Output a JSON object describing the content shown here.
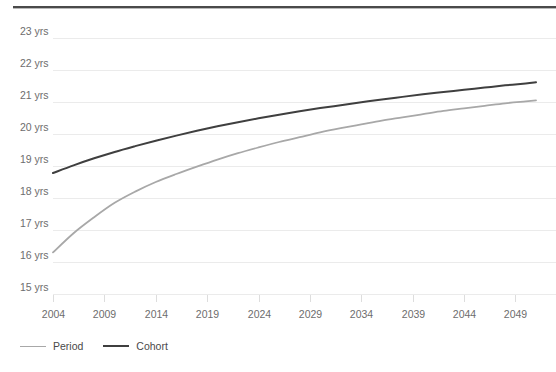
{
  "chart_data": {
    "type": "line",
    "title": "",
    "subtitle": "",
    "xlabel": "",
    "ylabel": "",
    "xlim": [
      2004,
      2051
    ],
    "ylim": [
      15,
      23
    ],
    "grid": true,
    "legend_position": "bottom-left",
    "y_tick_labels": [
      "23 yrs",
      "22 yrs",
      "21 yrs",
      "20 yrs",
      "19 yrs",
      "18 yrs",
      "17 yrs",
      "16 yrs",
      "15 yrs"
    ],
    "y_tick_values": [
      23,
      22,
      21,
      20,
      19,
      18,
      17,
      16,
      15
    ],
    "x_tick_labels": [
      "2004",
      "2009",
      "2014",
      "2019",
      "2024",
      "2029",
      "2034",
      "2039",
      "2044",
      "2049"
    ],
    "x_tick_values": [
      2004,
      2009,
      2014,
      2019,
      2024,
      2029,
      2034,
      2039,
      2044,
      2049
    ],
    "x": [
      2004,
      2006,
      2008,
      2010,
      2012,
      2014,
      2016,
      2018,
      2020,
      2022,
      2024,
      2026,
      2028,
      2030,
      2032,
      2034,
      2036,
      2038,
      2040,
      2042,
      2044,
      2046,
      2048,
      2050,
      2051
    ],
    "series": [
      {
        "name": "Period",
        "color": "#a8a8a8",
        "width": 1.8,
        "values": [
          16.3,
          16.9,
          17.4,
          17.85,
          18.2,
          18.5,
          18.75,
          18.98,
          19.2,
          19.4,
          19.58,
          19.75,
          19.9,
          20.05,
          20.18,
          20.3,
          20.42,
          20.52,
          20.62,
          20.72,
          20.8,
          20.88,
          20.96,
          21.02,
          21.05
        ]
      },
      {
        "name": "Cohort",
        "color": "#3f3f3f",
        "width": 2.0,
        "values": [
          18.78,
          19.02,
          19.24,
          19.44,
          19.62,
          19.79,
          19.95,
          20.1,
          20.24,
          20.37,
          20.49,
          20.6,
          20.71,
          20.81,
          20.9,
          20.99,
          21.08,
          21.16,
          21.24,
          21.31,
          21.38,
          21.45,
          21.52,
          21.58,
          21.62
        ]
      }
    ]
  },
  "legend": {
    "items": [
      {
        "label": "Period",
        "color": "#a8a8a8",
        "width": 1.8
      },
      {
        "label": "Cohort",
        "color": "#3f3f3f",
        "width": 2.6
      }
    ]
  },
  "colors": {
    "background": "#ffffff",
    "gridline": "#ebebeb",
    "axis_text": "#6d6d6d",
    "top_rule": "#4a4a4a",
    "period": "#a8a8a8",
    "cohort": "#3f3f3f"
  }
}
